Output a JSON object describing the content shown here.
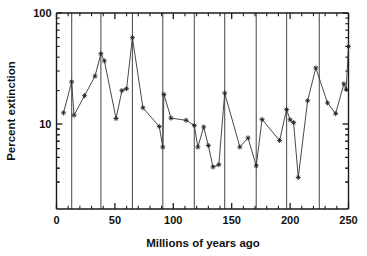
{
  "chart_data": {
    "type": "line",
    "title": "",
    "xlabel": "Millions of years ago",
    "ylabel": "Percent extinction",
    "xlim": [
      0,
      250
    ],
    "ylim": [
      2.2,
      100
    ],
    "yscale": "log",
    "grid": "vertical-only",
    "legend": "none",
    "xticks": [
      0,
      50,
      100,
      150,
      200,
      250
    ],
    "xticklabels": [
      "0",
      "50",
      "100",
      "150",
      "200",
      "250"
    ],
    "xminorticks": [
      10,
      20,
      30,
      40,
      60,
      70,
      80,
      90,
      110,
      120,
      130,
      140,
      160,
      170,
      180,
      190,
      210,
      220,
      230,
      240
    ],
    "yticks": [
      10,
      100
    ],
    "yticklabels": [
      "10",
      "100"
    ],
    "yminorticks": [
      3,
      4,
      5,
      6,
      7,
      8,
      9,
      20,
      30,
      40,
      50,
      60,
      70,
      80,
      90
    ],
    "gridlines_x": [
      13,
      38,
      65,
      91,
      118,
      144,
      171,
      197,
      225
    ],
    "marker": "star",
    "series": [
      {
        "name": "Percent extinction of marine genera",
        "points": [
          [
            6,
            12.6
          ],
          [
            13,
            24.0
          ],
          [
            15,
            12.0
          ],
          [
            24,
            18.0
          ],
          [
            33,
            27.0
          ],
          [
            38,
            43.0
          ],
          [
            41,
            37.0
          ],
          [
            51,
            11.2
          ],
          [
            56,
            20.0
          ],
          [
            60,
            20.8
          ],
          [
            65,
            60.0
          ],
          [
            74,
            14.0
          ],
          [
            88,
            9.5
          ],
          [
            91,
            6.2
          ],
          [
            92,
            18.5
          ],
          [
            98,
            11.3
          ],
          [
            111,
            10.8
          ],
          [
            118,
            9.7
          ],
          [
            121,
            6.2
          ],
          [
            126,
            9.4
          ],
          [
            130,
            6.4
          ],
          [
            134,
            4.1
          ],
          [
            139,
            4.3
          ],
          [
            144,
            19.0
          ],
          [
            157,
            6.2
          ],
          [
            164,
            7.5
          ],
          [
            171,
            4.2
          ],
          [
            176,
            11.0
          ],
          [
            191,
            7.1
          ],
          [
            197,
            13.5
          ],
          [
            200,
            10.9
          ],
          [
            203,
            10.3
          ],
          [
            207,
            3.3
          ],
          [
            215,
            16.2
          ],
          [
            222,
            32.0
          ],
          [
            232,
            15.5
          ],
          [
            239,
            12.4
          ],
          [
            246,
            23.0
          ],
          [
            248,
            20.5
          ],
          [
            250,
            50.0
          ]
        ]
      }
    ]
  },
  "axes": {
    "xlabel": "Millions of years ago",
    "ylabel": "Percent extinction"
  }
}
